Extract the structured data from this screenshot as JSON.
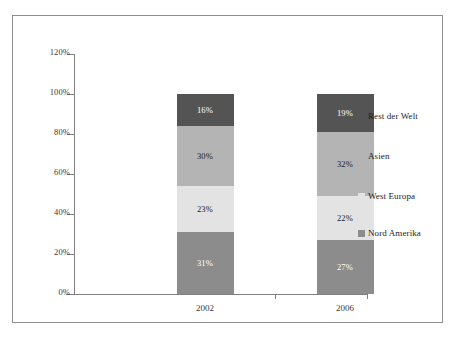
{
  "chart_data": {
    "type": "bar",
    "subtype": "stacked-100-percent",
    "title": "",
    "xlabel": "",
    "ylabel": "",
    "categories": [
      "2002",
      "2006"
    ],
    "ylim": [
      0,
      120
    ],
    "ytick_labels": [
      "0%",
      "20%",
      "40%",
      "60%",
      "80%",
      "100%",
      "120%"
    ],
    "ytick_values": [
      0,
      20,
      40,
      60,
      80,
      100,
      120
    ],
    "grid": false,
    "legend_position": "right",
    "series": [
      {
        "name": "Nord Amerika",
        "color": "#8c8c8c",
        "values": [
          31,
          27
        ],
        "value_labels": [
          "31%",
          "27%"
        ],
        "label_color": "light"
      },
      {
        "name": "West Europa",
        "color": "#e3e3e3",
        "values": [
          23,
          22
        ],
        "value_labels": [
          "23%",
          "22%"
        ],
        "label_color": "dark"
      },
      {
        "name": "Asien",
        "color": "#b4b4b4",
        "values": [
          30,
          32
        ],
        "value_labels": [
          "30%",
          "32%"
        ],
        "label_color": "dark"
      },
      {
        "name": "Rest der Welt",
        "color": "#545454",
        "values": [
          16,
          19
        ],
        "value_labels": [
          "16%",
          "19%"
        ],
        "label_color": "light"
      }
    ],
    "legend_entries": [
      {
        "label": "Rest der Welt",
        "color": "#545454"
      },
      {
        "label": "Asien",
        "color": "#b4b4b4"
      },
      {
        "label": "West Europa",
        "color": "#e3e3e3"
      },
      {
        "label": "Nord Amerika",
        "color": "#8c8c8c"
      }
    ],
    "axis_color": "#808080",
    "frame_color": "#8e8e8e",
    "background": "#ffffff"
  }
}
